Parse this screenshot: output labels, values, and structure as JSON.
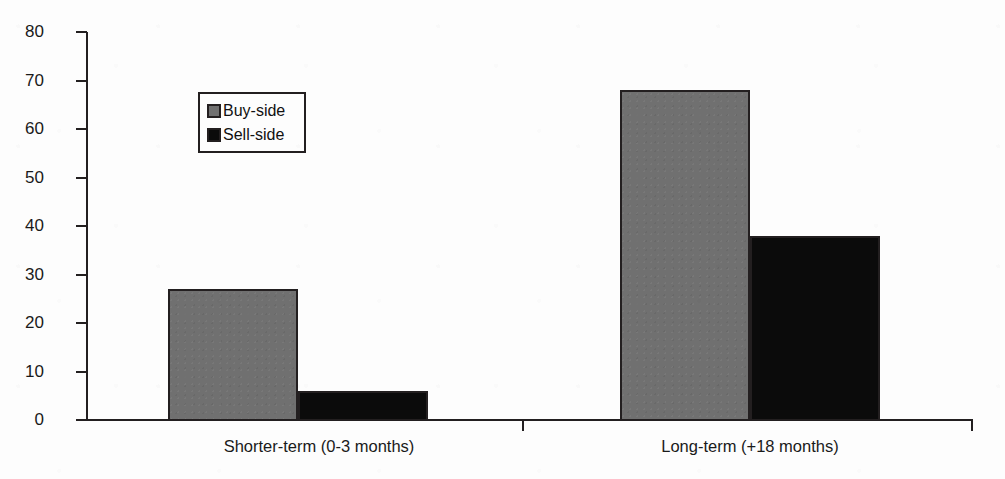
{
  "chart_data": {
    "type": "bar",
    "title": "",
    "xlabel": "",
    "ylabel": "",
    "ylim": [
      0,
      80
    ],
    "yticks": [
      0,
      10,
      20,
      30,
      40,
      50,
      60,
      70,
      80
    ],
    "ytick_labels": [
      "0",
      "10",
      "20",
      "30",
      "40",
      "50",
      "60",
      "70",
      "80"
    ],
    "grid": false,
    "legend_position": "upper-left-inside",
    "categories": [
      "Shorter-term (0-3 months)",
      "Long-term (+18 months)"
    ],
    "series": [
      {
        "name": "Buy-side",
        "color": "#707070",
        "values": [
          27,
          68
        ]
      },
      {
        "name": "Sell-side",
        "color": "#0b0b0b",
        "values": [
          6,
          38
        ]
      }
    ]
  },
  "legend": {
    "items": [
      {
        "label": "Buy-side",
        "swatch": "gray-square-swatch"
      },
      {
        "label": "Sell-side",
        "swatch": "black-square-swatch"
      }
    ]
  },
  "axes": {
    "y_labels": [
      "80",
      "70",
      "60",
      "50",
      "40",
      "30",
      "20",
      "10",
      "0"
    ],
    "x_labels": [
      "Shorter-term (0-3 months)",
      "Long-term (+18 months)"
    ]
  }
}
